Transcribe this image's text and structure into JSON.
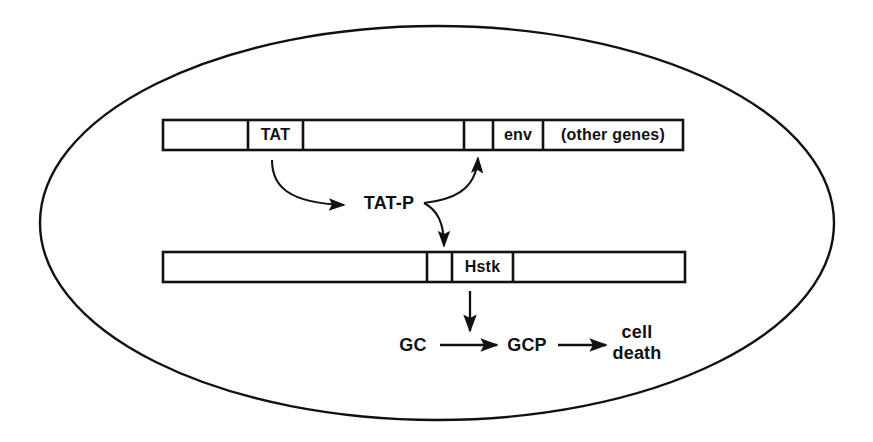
{
  "figure": {
    "background_color": "#ffffff",
    "stroke_color": "#111111",
    "width": 873,
    "height": 442
  },
  "cell_outline": {
    "name": "cell-boundary-ellipse",
    "shape": "ellipse",
    "cx": 437,
    "cy": 223,
    "rx": 397,
    "ry": 197,
    "stroke_width": 2.4
  },
  "constructs": [
    {
      "id": "viral-genome",
      "name": "Viral genome construct (upper bar)",
      "x": 163,
      "y": 120,
      "width": 520,
      "height": 30,
      "segments": [
        {
          "id": "ltr-5prime",
          "label": "",
          "x": 163,
          "width": 85
        },
        {
          "id": "tat",
          "label": "TAT",
          "x": 248,
          "width": 55
        },
        {
          "id": "spacer-mid",
          "label": "",
          "x": 303,
          "width": 161
        },
        {
          "id": "small-element",
          "label": "",
          "x": 464,
          "width": 29
        },
        {
          "id": "env",
          "label": "env",
          "x": 493,
          "width": 50
        },
        {
          "id": "other-genes",
          "label": "(other genes)",
          "x": 543,
          "width": 140
        }
      ]
    },
    {
      "id": "therapeutic-construct",
      "name": "Therapeutic construct (lower bar)",
      "x": 163,
      "y": 252,
      "width": 522,
      "height": 30,
      "segments": [
        {
          "id": "promoter-region",
          "label": "",
          "x": 163,
          "width": 264
        },
        {
          "id": "tar-element",
          "label": "",
          "x": 427,
          "width": 25
        },
        {
          "id": "hstk",
          "label": "Hstk",
          "x": 452,
          "width": 61
        },
        {
          "id": "downstream",
          "label": "",
          "x": 513,
          "width": 172
        }
      ]
    }
  ],
  "nodes": [
    {
      "id": "tat-protein",
      "label": "TAT-P",
      "x": 389,
      "y": 203,
      "lines": [
        "TAT-P"
      ]
    },
    {
      "id": "gc",
      "label": "GC",
      "x": 413,
      "y": 345,
      "lines": [
        "GC"
      ]
    },
    {
      "id": "gcp",
      "label": "GCP",
      "x": 527,
      "y": 345,
      "lines": [
        "GCP"
      ]
    },
    {
      "id": "cell-death",
      "label": "cell death",
      "x": 637,
      "y": 343,
      "lines": [
        "cell",
        "death"
      ]
    }
  ],
  "arrows": [
    {
      "id": "tat-gene-to-tat-protein",
      "name": "arrow-tat-gene-to-tat-protein",
      "kind": "curved",
      "from": "tat",
      "to": "tat-protein",
      "path": "M 272,160 C 272,186 288,203 344,205"
    },
    {
      "id": "tat-protein-to-tar-upper",
      "name": "arrow-tat-protein-to-viral-tar",
      "kind": "curved",
      "from": "tat-protein",
      "to": "small-element",
      "path": "M 424,203 C 450,200 476,192 478,158"
    },
    {
      "id": "tat-protein-to-tar-lower",
      "name": "arrow-tat-protein-to-construct-tar",
      "kind": "curved",
      "from": "tat-protein",
      "to": "tar-element",
      "path": "M 424,203 C 437,210 444,222 444,246"
    },
    {
      "id": "hstk-to-reaction",
      "name": "arrow-hstk-to-gc-conversion",
      "kind": "straight",
      "from": "hstk",
      "to": "gc-to-gcp",
      "path": "M 470,291 L 470,331"
    },
    {
      "id": "gc-to-gcp",
      "name": "arrow-gc-to-gcp",
      "kind": "straight",
      "from": "gc",
      "to": "gcp",
      "path": "M 440,345 L 497,345"
    },
    {
      "id": "gcp-to-cell-death",
      "name": "arrow-gcp-to-cell-death",
      "kind": "straight",
      "from": "gcp",
      "to": "cell-death",
      "path": "M 558,345 L 606,345"
    }
  ]
}
